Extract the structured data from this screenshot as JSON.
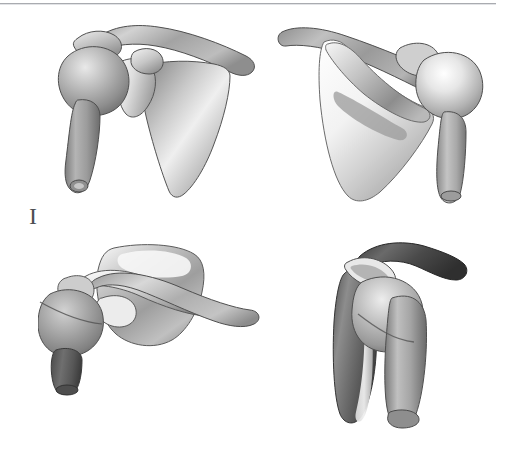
{
  "figure": {
    "label": "I",
    "caption_rule": true,
    "background_color": "#ffffff",
    "rule_color": "#a9abb0",
    "width": 507,
    "height": 458
  },
  "panels": [
    {
      "id": "anterior",
      "name": "shoulder-anterior-view",
      "title": "Anterior view of shoulder girdle",
      "bones": [
        "humerus",
        "scapula",
        "clavicle"
      ],
      "render_style": "grayscale-shaded-3d"
    },
    {
      "id": "posterior",
      "name": "shoulder-posterior-view",
      "title": "Posterior view of shoulder girdle",
      "bones": [
        "humerus",
        "scapula",
        "clavicle"
      ],
      "render_style": "grayscale-shaded-3d"
    },
    {
      "id": "superior",
      "name": "shoulder-superior-view",
      "title": "Superior view of shoulder girdle",
      "bones": [
        "humerus",
        "scapula",
        "clavicle"
      ],
      "render_style": "grayscale-shaded-3d"
    },
    {
      "id": "lateral",
      "name": "shoulder-lateral-view",
      "title": "Lateral view of shoulder girdle",
      "bones": [
        "humerus",
        "scapula",
        "clavicle"
      ],
      "render_style": "grayscale-shaded-3d"
    }
  ],
  "palette": {
    "bone_light": "#f2f2f2",
    "bone_mid": "#b6b6b6",
    "bone_dark": "#6f6f6f",
    "bone_darkest": "#3a3a3a",
    "outline": "#5a5a5a",
    "label_text": "#4d4f52"
  }
}
